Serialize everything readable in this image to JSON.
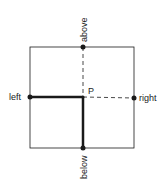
{
  "diagram": {
    "center_label": "P",
    "labels": {
      "left": "left",
      "right": "right",
      "above": "above",
      "below": "below"
    },
    "colors": {
      "stroke": "#1a1a1a",
      "background": "#ffffff"
    }
  }
}
